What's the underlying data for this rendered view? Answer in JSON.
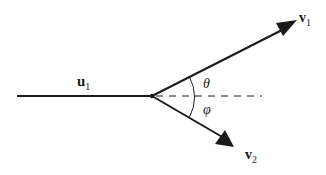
{
  "diagram": {
    "incoming": {
      "label": "u",
      "subscript": "1"
    },
    "outgoing_1": {
      "label": "v",
      "subscript": "1"
    },
    "outgoing_2": {
      "label": "v",
      "subscript": "2"
    },
    "angle_upper": {
      "label": "θ"
    },
    "angle_lower": {
      "label": "φ"
    },
    "colors": {
      "stroke": "#1a1a1a",
      "background": "#ffffff"
    }
  }
}
